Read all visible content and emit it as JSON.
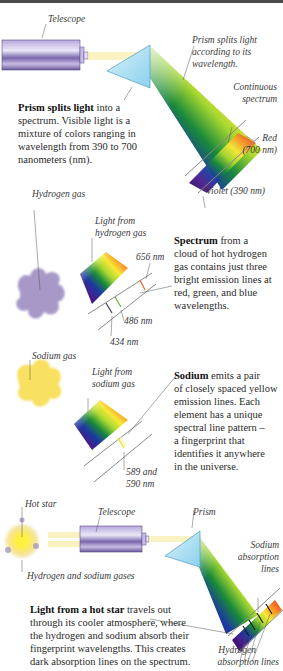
{
  "sections": {
    "continuous": {
      "labels": {
        "telescope": "Telescope",
        "prism_note": "Prism splits light according to its wavelength.",
        "prism_note_lines": [
          "Prism splits light",
          "according to its",
          "wavelength."
        ],
        "continuous_spectrum": [
          "Continuous",
          "spectrum"
        ],
        "red": [
          "Red",
          "(700 nm)"
        ],
        "violet": "Violet (390 nm)"
      },
      "caption": {
        "bold": "Prism splits light",
        "rest_lines": [
          " into a",
          "spectrum. Visible light is a",
          "mixture of colors ranging in",
          "wavelength from 390 to 700",
          "nanometers (nm)."
        ]
      }
    },
    "hydrogen": {
      "labels": {
        "gas": "Hydrogen gas",
        "light_from": [
          "Light from",
          "hydrogen gas"
        ],
        "line_656": "656 nm",
        "line_486": "486 nm",
        "line_434": "434 nm"
      },
      "caption": {
        "bold": "Spectrum",
        "rest_lines": [
          " from a",
          "cloud of hot hydrogen",
          "gas contains just three",
          "bright emission lines at",
          "red, green, and blue",
          "wavelengths."
        ]
      },
      "emission_lines_nm": [
        656,
        486,
        434
      ],
      "emission_colors": [
        "#e06a2a",
        "#5fb83a",
        "#3a3a5a"
      ]
    },
    "sodium": {
      "labels": {
        "gas": "Sodium gas",
        "light_from": [
          "Light from",
          "sodium gas"
        ],
        "lines": [
          "589 and",
          "590 nm"
        ]
      },
      "caption": {
        "bold": "Sodium",
        "rest_lines": [
          " emits a pair",
          "of closely spaced yellow",
          "emission lines. Each",
          "element has a unique",
          "spectral line pattern –",
          "a fingerprint that",
          "identifies it anywhere",
          "in the universe."
        ]
      },
      "emission_lines_nm": [
        589,
        590
      ],
      "emission_color": "#e8e84a"
    },
    "absorption": {
      "labels": {
        "hot_star": "Hot star",
        "telescope": "Telescope",
        "prism": "Prism",
        "gases": "Hydrogen and sodium gases",
        "sodium_lines": [
          "Sodium",
          "absorption",
          "lines"
        ],
        "hydrogen_lines": [
          "Hydrogen",
          "absorption lines"
        ]
      },
      "caption": {
        "bold": "Light from a hot star",
        "rest_lines": [
          " travels out",
          "through its cooler atmosphere, where",
          "the hydrogen and sodium absorb their",
          "fingerprint wavelengths. This creates",
          "dark absorption lines on the spectrum."
        ]
      }
    }
  },
  "colors": {
    "telescope": "#8a78b8",
    "prism": "#a8dcf0",
    "hydrogen_cloud": "#a898c8",
    "sodium_cloud": "#f8e060",
    "star_core": "#fff040",
    "light_beam": "#f8f0b0"
  }
}
